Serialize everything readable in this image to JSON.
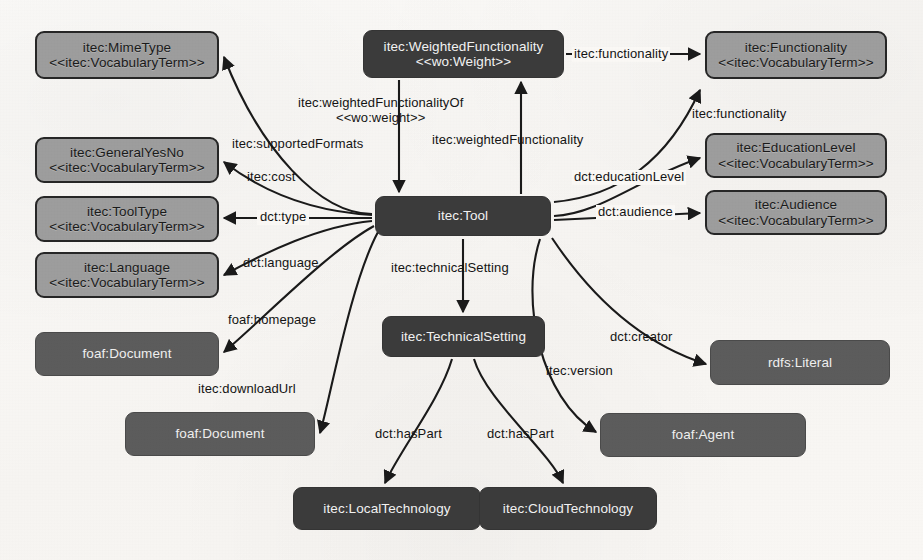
{
  "diagram": {
    "background_color": "#faf8f5",
    "light_node_color": "#9d9d9d",
    "dark_node_color": "#3b3b3b",
    "mid_node_color": "#5c5c5c",
    "edge_color": "#1a1a1a"
  },
  "nodes": [
    {
      "id": "mimeType",
      "line1": "itec:MimeType",
      "line2": "<<itec:VocabularyTerm>>",
      "style": "light",
      "x": 35,
      "y": 31,
      "w": 184,
      "h": 48
    },
    {
      "id": "generalYesNo",
      "line1": "itec:GeneralYesNo",
      "line2": "<<itec:VocabularyTerm>>",
      "style": "light",
      "x": 35,
      "y": 137,
      "w": 184,
      "h": 46
    },
    {
      "id": "toolType",
      "line1": "itec:ToolType",
      "line2": "<<itec:VocabularyTerm>>",
      "style": "light",
      "x": 35,
      "y": 196,
      "w": 184,
      "h": 46
    },
    {
      "id": "language",
      "line1": "itec:Language",
      "line2": "<<itec:VocabularyTerm>>",
      "style": "light",
      "x": 35,
      "y": 252,
      "w": 184,
      "h": 46
    },
    {
      "id": "foafDocumentHomepage",
      "line1": "foaf:Document",
      "line2": "",
      "style": "mid",
      "x": 35,
      "y": 332,
      "w": 184,
      "h": 44
    },
    {
      "id": "foafDocumentDownload",
      "line1": "foaf:Document",
      "line2": "",
      "style": "mid",
      "x": 125,
      "y": 412,
      "w": 190,
      "h": 44
    },
    {
      "id": "weightedFunctionality",
      "line1": "itec:WeightedFunctionality",
      "line2": "<<wo:Weight>>",
      "style": "dark",
      "x": 363,
      "y": 30,
      "w": 201,
      "h": 48
    },
    {
      "id": "tool",
      "line1": "itec:Tool",
      "line2": "",
      "style": "dark",
      "x": 375,
      "y": 196,
      "w": 176,
      "h": 40
    },
    {
      "id": "technicalSetting",
      "line1": "itec:TechnicalSetting",
      "line2": "",
      "style": "dark",
      "x": 382,
      "y": 316,
      "w": 163,
      "h": 41
    },
    {
      "id": "localTechnology",
      "line1": "itec:LocalTechnology",
      "line2": "",
      "style": "dark",
      "x": 293,
      "y": 487,
      "w": 188,
      "h": 43
    },
    {
      "id": "cloudTechnology",
      "line1": "itec:CloudTechnology",
      "line2": "",
      "style": "dark",
      "x": 479,
      "y": 487,
      "w": 178,
      "h": 43
    },
    {
      "id": "functionality",
      "line1": "itec:Functionality",
      "line2": "<<itec:VocabularyTerm>>",
      "style": "light",
      "x": 705,
      "y": 31,
      "w": 182,
      "h": 48
    },
    {
      "id": "educationLevel",
      "line1": "itec:EducationLevel",
      "line2": "<<itec:VocabularyTerm>>",
      "style": "light",
      "x": 705,
      "y": 133,
      "w": 182,
      "h": 45
    },
    {
      "id": "audience",
      "line1": "itec:Audience",
      "line2": "<<itec:VocabularyTerm>>",
      "style": "light",
      "x": 705,
      "y": 190,
      "w": 182,
      "h": 45
    },
    {
      "id": "rdfsLiteral",
      "line1": "rdfs:Literal",
      "line2": "",
      "style": "mid",
      "x": 710,
      "y": 340,
      "w": 180,
      "h": 45
    },
    {
      "id": "foafAgent",
      "line1": "foaf:Agent",
      "line2": "",
      "style": "mid",
      "x": 600,
      "y": 413,
      "w": 206,
      "h": 44
    }
  ],
  "edges": [
    {
      "id": "supportedFormats",
      "label_line1": "itec:supportedFormats",
      "label_line2": "",
      "from": "tool",
      "to": "mimeType",
      "lx": 232,
      "ly": 137
    },
    {
      "id": "cost",
      "label_line1": "itec:cost",
      "label_line2": "",
      "from": "tool",
      "to": "generalYesNo",
      "lx": 247,
      "ly": 170
    },
    {
      "id": "type",
      "label_line1": "dct:type",
      "label_line2": "",
      "from": "tool",
      "to": "toolType",
      "lx": 257,
      "ly": 210
    },
    {
      "id": "language",
      "label_line1": "dct:language",
      "label_line2": "",
      "from": "tool",
      "to": "language",
      "lx": 243,
      "ly": 256
    },
    {
      "id": "homepage",
      "label_line1": "foaf:homepage",
      "label_line2": "",
      "from": "tool",
      "to": "foafDocumentHomepage",
      "lx": 228,
      "ly": 313
    },
    {
      "id": "downloadUrl",
      "label_line1": "itec:downloadUrl",
      "label_line2": "",
      "from": "tool",
      "to": "foafDocumentDownload",
      "lx": 198,
      "ly": 382
    },
    {
      "id": "weightedFunctionalityOf",
      "label_line1": "itec:weightedFunctionalityOf",
      "label_line2": "<<wo:weight>>",
      "from": "weightedFunctionality",
      "to": "tool",
      "lx": 298,
      "ly": 98
    },
    {
      "id": "weightedFunctionality",
      "label_line1": "itec:weightedFunctionality",
      "label_line2": "",
      "from": "tool",
      "to": "weightedFunctionality",
      "lx": 432,
      "ly": 133
    },
    {
      "id": "functionalityFromWeighted",
      "label_line1": "itec:functionality",
      "label_line2": "",
      "from": "weightedFunctionality",
      "to": "functionality",
      "lx": 572,
      "ly": 47
    },
    {
      "id": "functionalityFromTool",
      "label_line1": "itec:functionality",
      "label_line2": "",
      "from": "tool",
      "to": "functionality",
      "lx": 692,
      "ly": 107
    },
    {
      "id": "educationLevel",
      "label_line1": "dct:educationLevel",
      "label_line2": "",
      "from": "tool",
      "to": "educationLevel",
      "lx": 572,
      "ly": 170
    },
    {
      "id": "audience",
      "label_line1": "dct:audience",
      "label_line2": "",
      "from": "tool",
      "to": "audience",
      "lx": 596,
      "ly": 205
    },
    {
      "id": "technicalSetting",
      "label_line1": "itec:technicalSetting",
      "label_line2": "",
      "from": "tool",
      "to": "technicalSetting",
      "lx": 391,
      "ly": 261
    },
    {
      "id": "creator",
      "label_line1": "dct:creator",
      "label_line2": "",
      "from": "tool",
      "to": "rdfsLiteral",
      "lx": 610,
      "ly": 330
    },
    {
      "id": "version",
      "label_line1": "itec:version",
      "label_line2": "",
      "from": "tool",
      "to": "foafAgent",
      "lx": 546,
      "ly": 364
    },
    {
      "id": "hasPartLocal",
      "label_line1": "dct:hasPart",
      "label_line2": "",
      "from": "technicalSetting",
      "to": "localTechnology",
      "lx": 375,
      "ly": 427
    },
    {
      "id": "hasPartCloud",
      "label_line1": "dct:hasPart",
      "label_line2": "",
      "from": "technicalSetting",
      "to": "cloudTechnology",
      "lx": 487,
      "ly": 427
    }
  ]
}
